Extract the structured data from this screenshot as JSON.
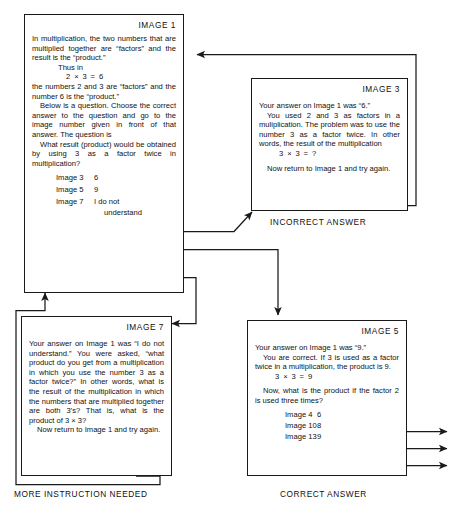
{
  "diagram": {
    "line_color": "#1a1a1a"
  },
  "boxes": {
    "image1": {
      "label": "IMAGE 1",
      "p1": "In multiplication, the two numbers that are multiplied together are “factors” and the result is the “product.”",
      "p2": "Thus in",
      "eq": "2 × 3 = 6",
      "p3": "the numbers 2 and 3 are “factors” and the number 6 is the “product.”",
      "p4": "Below is a question. Choose the correct answer to the question and go to the image number given in front of that answer. The question is",
      "p5": "What result (product) would be obtained by using 3 as a factor twice in multiplication?",
      "choices": [
        {
          "image": "Image 3",
          "value": "6"
        },
        {
          "image": "Image 5",
          "value": "9"
        },
        {
          "image": "Image 7",
          "value": "I do not",
          "value2": "understand"
        }
      ]
    },
    "image3": {
      "label": "IMAGE 3",
      "p1": "Your answer on Image 1 was “6.”",
      "p2": "You used 2 and 3 as factors in a muliplication. The problem was to use the number 3 as a factor twice. In other words, the result of the multiplication",
      "eq": "3 × 3 = ?",
      "p3": "Now return to Image 1 and try again.",
      "caption": "INCORRECT ANSWER"
    },
    "image7": {
      "label": "IMAGE 7",
      "p1": "Your answer on Image 1 was “I do not understand.” You were asked, “what product do you get from a multiplication in which you use the number 3 as a factor twice?” In other words, what is the result of the multiplication in which the numbers that are multiplied together are both 3’s? That is, what is the product of 3 × 3?",
      "p2": "Now return to Image 1 and try again.",
      "caption": "MORE INSTRUCTION NEEDED"
    },
    "image5": {
      "label": "IMAGE 5",
      "p1": "Your answer on Image 1 was “9.”",
      "p2": "You are correct. If 3 is used as a factor twice in a multiplication, the product is 9.",
      "eq": "3 × 3 = 9",
      "p3": "Now, what is the product if the factor 2 is used three times?",
      "choices": [
        {
          "image": "Image 4",
          "value": "6"
        },
        {
          "image": "Image 10",
          "value": "8"
        },
        {
          "image": "Image 13",
          "value": "9"
        }
      ],
      "caption": "CORRECT ANSWER"
    }
  }
}
